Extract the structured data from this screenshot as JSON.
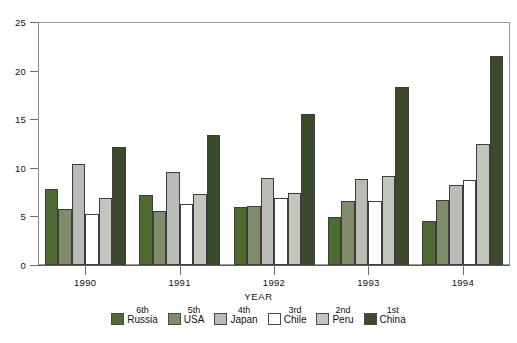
{
  "chart_data": {
    "type": "bar",
    "title": "",
    "subtitle": "",
    "xlabel": "YEAR",
    "ylabel": "",
    "categories": [
      "1990",
      "1991",
      "1992",
      "1993",
      "1994"
    ],
    "ylim": [
      0,
      25
    ],
    "yticks": [
      0,
      5,
      10,
      15,
      20,
      25
    ],
    "ytick_labels": [
      "0",
      "5",
      "10",
      "15",
      "20",
      "25"
    ],
    "grid": false,
    "legend_position": "bottom",
    "series": [
      {
        "name": "Russia",
        "rank": "6th",
        "color": "#4e6b32",
        "values": [
          7.8,
          7.2,
          6.0,
          4.9,
          4.5
        ]
      },
      {
        "name": "USA",
        "rank": "5th",
        "color": "#7e8c6a",
        "values": [
          5.8,
          5.6,
          6.1,
          6.6,
          6.7
        ]
      },
      {
        "name": "Japan",
        "rank": "4th",
        "color": "#b9bcb4",
        "values": [
          10.4,
          9.6,
          9.0,
          8.9,
          8.2
        ]
      },
      {
        "name": "Chile",
        "rank": "3rd",
        "color": "#ffffff",
        "values": [
          5.2,
          6.3,
          6.9,
          6.6,
          8.7
        ]
      },
      {
        "name": "Peru",
        "rank": "2nd",
        "color": "#c3c6bd",
        "values": [
          6.9,
          7.3,
          7.4,
          9.2,
          12.5
        ]
      },
      {
        "name": "China",
        "rank": "1st",
        "color": "#3b4a2a",
        "values": [
          12.1,
          13.4,
          15.5,
          18.3,
          21.5
        ]
      }
    ]
  },
  "axes": {
    "x_title": "YEAR"
  }
}
